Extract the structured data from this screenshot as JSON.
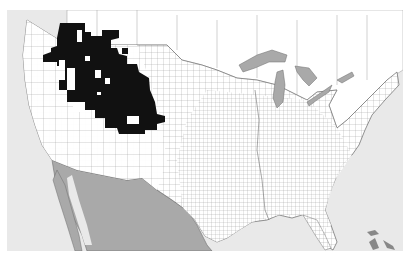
{
  "map": {
    "type": "choropleth",
    "subject": "United States counties",
    "colors": {
      "ocean": "#e9e9e9",
      "land": "#ffffff",
      "foreign_land_south": "#a9a9a9",
      "lakes": "#a9a9a9",
      "county_lines": "#8a8a8a",
      "highlight": "#111111"
    },
    "legend": [],
    "highlighted_region": {
      "label": "",
      "approx_area": "Intermountain West (ID, MT, WY, UT, CO, NV, OR)"
    }
  }
}
